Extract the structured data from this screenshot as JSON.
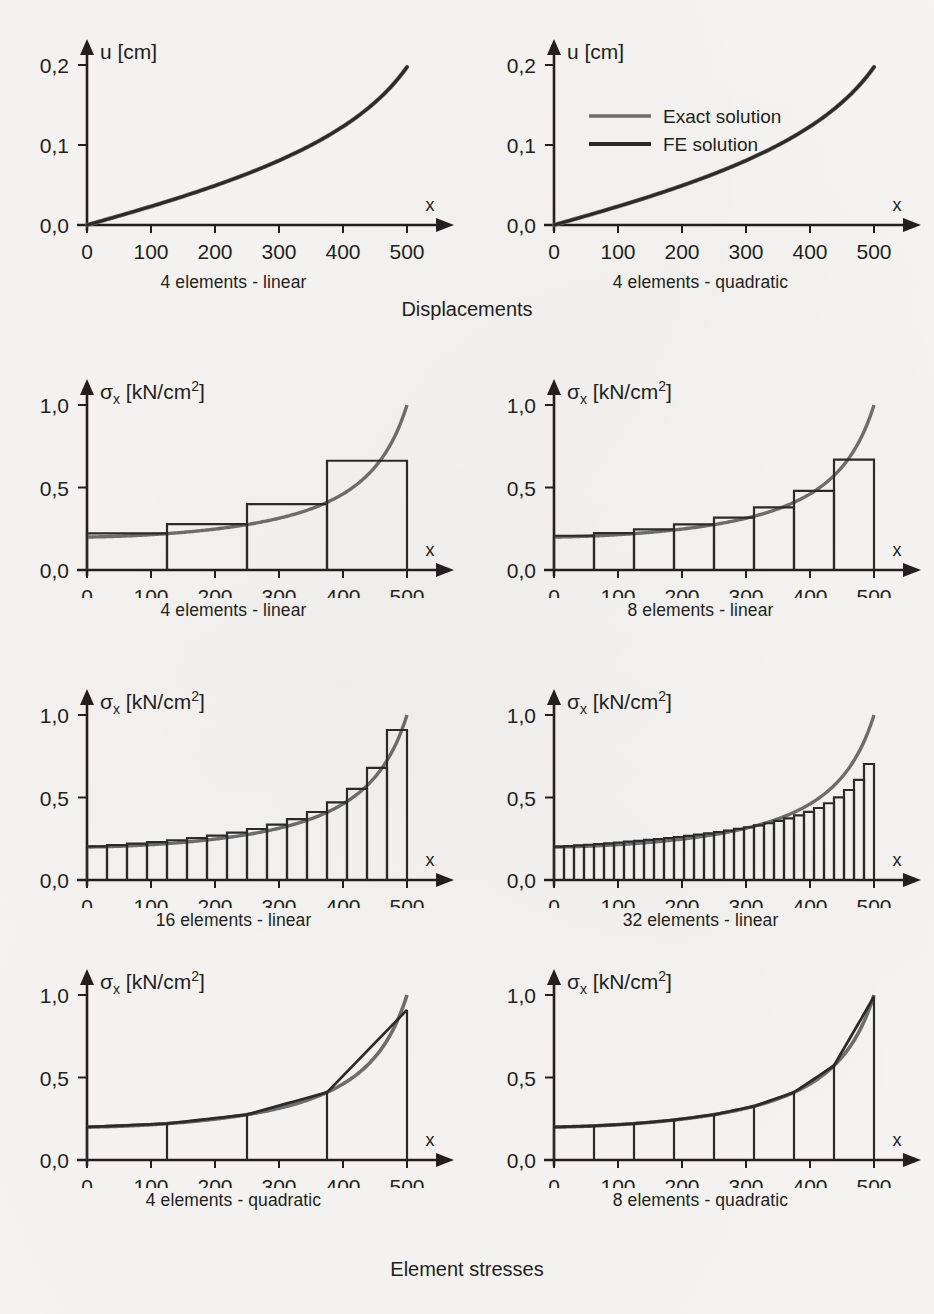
{
  "figure": {
    "background": "#f6f5f3",
    "exact_color": "#6e6e6e",
    "fe_color": "#2b2b2b",
    "axis_color": "#231f20",
    "section_titles": {
      "displacements": "Displacements",
      "element_stresses": "Element stresses"
    },
    "legend": {
      "exact": "Exact solution",
      "fe": "FE solution"
    }
  },
  "axes": {
    "x_label": "x",
    "x_ticks": [
      "0",
      "100",
      "200",
      "300",
      "400",
      "500"
    ],
    "x_values": [
      0,
      100,
      200,
      300,
      400,
      500
    ],
    "xlim": [
      0,
      500
    ],
    "u_label": "u [cm]",
    "u_ticks": [
      "0,0",
      "0,1",
      "0,2"
    ],
    "u_values": [
      0.0,
      0.1,
      0.2
    ],
    "ulim": [
      0,
      0.2
    ],
    "sigma_label_main": "σ",
    "sigma_label_sub": "x",
    "sigma_label_unit": "[kN/cm",
    "sigma_label_sup": "2",
    "sigma_label_close": "]",
    "sigma_ticks": [
      "0,0",
      "0,5",
      "1,0"
    ],
    "sigma_values": [
      0.0,
      0.5,
      1.0
    ],
    "sigmalim": [
      0,
      1.0
    ]
  },
  "chart_data": [
    {
      "id": "u-4-linear",
      "type": "line",
      "title": "4 elements - linear",
      "xlabel": "x",
      "ylabel": "u [cm]",
      "xlim": [
        0,
        500
      ],
      "ylim": [
        0,
        0.2
      ],
      "grid": false,
      "legend": "none",
      "series": [
        {
          "name": "Exact solution",
          "color": "#6e6e6e",
          "x": [
            0,
            50,
            100,
            150,
            200,
            250,
            300,
            350,
            400,
            450,
            500
          ],
          "values": [
            0.0,
            0.0105,
            0.0216,
            0.0335,
            0.0463,
            0.0602,
            0.0756,
            0.093,
            0.1133,
            0.1387,
            0.1975
          ]
        },
        {
          "name": "FE solution",
          "color": "#2b2b2b",
          "x": [
            0,
            125,
            250,
            375,
            500
          ],
          "values": [
            0.0,
            0.0278,
            0.0602,
            0.1018,
            0.1975
          ]
        }
      ]
    },
    {
      "id": "u-4-quadratic",
      "type": "line",
      "title": "4 elements - quadratic",
      "xlabel": "x",
      "ylabel": "u [cm]",
      "xlim": [
        0,
        500
      ],
      "ylim": [
        0,
        0.2
      ],
      "grid": false,
      "legend": "inside-top-left",
      "series": [
        {
          "name": "Exact solution",
          "color": "#6e6e6e",
          "x": [
            0,
            50,
            100,
            150,
            200,
            250,
            300,
            350,
            400,
            450,
            500
          ],
          "values": [
            0.0,
            0.0105,
            0.0216,
            0.0335,
            0.0463,
            0.0602,
            0.0756,
            0.093,
            0.1133,
            0.1387,
            0.1975
          ]
        },
        {
          "name": "FE solution",
          "color": "#2b2b2b",
          "x": [
            0,
            50,
            100,
            150,
            200,
            250,
            300,
            350,
            400,
            450,
            500
          ],
          "values": [
            0.0,
            0.0105,
            0.0216,
            0.0335,
            0.0463,
            0.0602,
            0.0756,
            0.093,
            0.1133,
            0.1387,
            0.1975
          ]
        }
      ]
    },
    {
      "id": "sigma-4-linear",
      "type": "bar",
      "subtype": "step-histogram",
      "title": "4 elements - linear",
      "xlabel": "x",
      "ylabel": "σx [kN/cm2]",
      "xlim": [
        0,
        500
      ],
      "ylim": [
        0,
        1.0
      ],
      "grid": false,
      "n_elements": 4,
      "element_edges": [
        0,
        125,
        250,
        375,
        500
      ],
      "values": [
        0.2225,
        0.278,
        0.399,
        0.662
      ],
      "exact_curve": {
        "name": "Exact solution",
        "color": "#6e6e6e",
        "x": [
          0,
          50,
          100,
          150,
          200,
          250,
          300,
          350,
          400,
          450,
          500
        ],
        "values": [
          0.2,
          0.2155,
          0.2345,
          0.258,
          0.2875,
          0.3255,
          0.376,
          0.4465,
          0.551,
          0.723,
          1.0
        ]
      }
    },
    {
      "id": "sigma-8-linear",
      "type": "bar",
      "subtype": "step-histogram",
      "title": "8 elements - linear",
      "xlabel": "x",
      "ylabel": "σx [kN/cm2]",
      "xlim": [
        0,
        500
      ],
      "ylim": [
        0,
        1.0
      ],
      "grid": false,
      "n_elements": 8,
      "element_edges": [
        0,
        62.5,
        125,
        187.5,
        250,
        312.5,
        375,
        437.5,
        500
      ],
      "values": [
        0.2075,
        0.224,
        0.246,
        0.276,
        0.318,
        0.38,
        0.479,
        0.669
      ],
      "exact_curve": {
        "name": "Exact solution",
        "color": "#6e6e6e",
        "x": [
          0,
          50,
          100,
          150,
          200,
          250,
          300,
          350,
          400,
          450,
          500
        ],
        "values": [
          0.2,
          0.2155,
          0.2345,
          0.258,
          0.2875,
          0.3255,
          0.376,
          0.4465,
          0.551,
          0.723,
          1.0
        ]
      }
    },
    {
      "id": "sigma-16-linear",
      "type": "bar",
      "subtype": "step-histogram",
      "title": "16 elements - linear",
      "xlabel": "x",
      "ylabel": "σx [kN/cm2]",
      "xlim": [
        0,
        500
      ],
      "ylim": [
        0,
        1.0
      ],
      "grid": false,
      "n_elements": 16,
      "element_edges": [
        0,
        31.25,
        62.5,
        93.75,
        125,
        156.25,
        187.5,
        218.75,
        250,
        281.25,
        312.5,
        343.75,
        375,
        406.25,
        437.5,
        468.75,
        500
      ],
      "values": [
        0.2038,
        0.2115,
        0.22,
        0.2298,
        0.241,
        0.254,
        0.2692,
        0.2872,
        0.309,
        0.3356,
        0.369,
        0.412,
        0.47,
        0.552,
        0.679,
        0.909
      ],
      "exact_curve": {
        "name": "Exact solution",
        "color": "#6e6e6e",
        "x": [
          0,
          50,
          100,
          150,
          200,
          250,
          300,
          350,
          400,
          450,
          500
        ],
        "values": [
          0.2,
          0.2155,
          0.2345,
          0.258,
          0.2875,
          0.3255,
          0.376,
          0.4465,
          0.551,
          0.723,
          1.0
        ]
      }
    },
    {
      "id": "sigma-32-linear",
      "type": "bar",
      "subtype": "step-histogram",
      "title": "32 elements - linear",
      "xlabel": "x",
      "ylabel": "σx [kN/cm2]",
      "xlim": [
        0,
        500
      ],
      "ylim": [
        0,
        1.0
      ],
      "grid": false,
      "n_elements": 32,
      "values": [
        0.2019,
        0.2057,
        0.2096,
        0.2137,
        0.218,
        0.2225,
        0.2272,
        0.2321,
        0.2372,
        0.2426,
        0.2483,
        0.2543,
        0.2607,
        0.2675,
        0.2747,
        0.2824,
        0.2907,
        0.2996,
        0.3093,
        0.3198,
        0.3313,
        0.344,
        0.3581,
        0.3739,
        0.3918,
        0.4124,
        0.4364,
        0.4651,
        0.5003,
        0.5454,
        0.6073,
        0.703
      ],
      "exact_curve": {
        "name": "Exact solution",
        "color": "#6e6e6e",
        "x": [
          0,
          50,
          100,
          150,
          200,
          250,
          300,
          350,
          400,
          450,
          500
        ],
        "values": [
          0.2,
          0.2155,
          0.2345,
          0.258,
          0.2875,
          0.3255,
          0.376,
          0.4465,
          0.551,
          0.723,
          1.0
        ]
      }
    },
    {
      "id": "sigma-4-quadratic",
      "type": "area",
      "subtype": "continuous-with-element-dividers",
      "title": "4 elements - quadratic",
      "xlabel": "x",
      "ylabel": "σx [kN/cm2]",
      "xlim": [
        0,
        500
      ],
      "ylim": [
        0,
        1.0
      ],
      "grid": false,
      "n_elements": 4,
      "element_edges": [
        0,
        125,
        250,
        375,
        500
      ],
      "fe_values_at_edges": [
        0.2,
        0.246,
        0.3255,
        0.479,
        0.91
      ],
      "exact_curve": {
        "name": "Exact solution",
        "color": "#6e6e6e",
        "x": [
          0,
          50,
          100,
          150,
          200,
          250,
          300,
          350,
          400,
          450,
          500
        ],
        "values": [
          0.2,
          0.2155,
          0.2345,
          0.258,
          0.2875,
          0.3255,
          0.376,
          0.4465,
          0.551,
          0.723,
          1.0
        ]
      }
    },
    {
      "id": "sigma-8-quadratic",
      "type": "area",
      "subtype": "continuous-with-element-dividers",
      "title": "8 elements - quadratic",
      "xlabel": "x",
      "ylabel": "σx [kN/cm2]",
      "xlim": [
        0,
        500
      ],
      "ylim": [
        0,
        1.0
      ],
      "grid": false,
      "n_elements": 8,
      "element_edges": [
        0,
        62.5,
        125,
        187.5,
        250,
        312.5,
        375,
        437.5,
        500
      ],
      "fe_values_at_edges": [
        0.2,
        0.221,
        0.246,
        0.28,
        0.3255,
        0.388,
        0.479,
        0.629,
        0.99
      ],
      "exact_curve": {
        "name": "Exact solution",
        "color": "#6e6e6e",
        "x": [
          0,
          50,
          100,
          150,
          200,
          250,
          300,
          350,
          400,
          450,
          500
        ],
        "values": [
          0.2,
          0.2155,
          0.2345,
          0.258,
          0.2875,
          0.3255,
          0.376,
          0.4465,
          0.551,
          0.723,
          1.0
        ]
      }
    }
  ],
  "panels": [
    {
      "caption": "4 elements - linear"
    },
    {
      "caption": "4 elements - quadratic"
    },
    {
      "caption": "4 elements - linear"
    },
    {
      "caption": "8 elements - linear"
    },
    {
      "caption": "16 elements - linear"
    },
    {
      "caption": "32 elements - linear"
    },
    {
      "caption": "4 elements - quadratic"
    },
    {
      "caption": "8 elements - quadratic"
    }
  ]
}
